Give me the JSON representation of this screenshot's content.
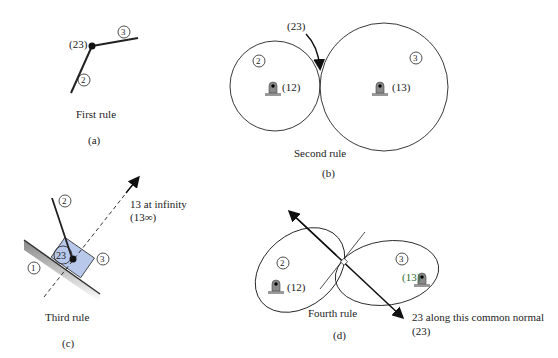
{
  "panels": {
    "a": {
      "caption": "(a)",
      "title": "First rule",
      "joint_label": "(23)",
      "link_labels": [
        "2",
        "3"
      ]
    },
    "b": {
      "caption": "(b)",
      "title": "Second rule",
      "contact_label": "(23)",
      "pivot_left": "(12)",
      "pivot_right": "(13)",
      "link_labels": [
        "2",
        "3"
      ]
    },
    "c": {
      "caption": "(c)",
      "title": "Third rule",
      "slider_label": "23",
      "infinity_line1": "13 at infinity",
      "infinity_line2": "(13∞)",
      "link_labels": [
        "1",
        "2",
        "3"
      ],
      "slider_color": "#b8c8ea"
    },
    "d": {
      "caption": "(d)",
      "title": "Fourth rule",
      "normal_line1": "23 along this common normal",
      "normal_line2": "(23)",
      "pivot_left": "(12)",
      "pivot_right": "(13)",
      "link_labels": [
        "2",
        "3"
      ]
    }
  }
}
